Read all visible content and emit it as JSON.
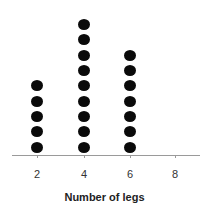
{
  "chart_data": {
    "type": "dot",
    "title": "",
    "xlabel": "Number of legs",
    "ylabel": "",
    "categories": [
      "2",
      "4",
      "6",
      "8"
    ],
    "x": [
      2,
      4,
      6,
      8
    ],
    "values": [
      5,
      9,
      7,
      0
    ],
    "xlim": [
      1.2,
      9.0
    ],
    "xticks": [
      2,
      4,
      6,
      8
    ],
    "grid": false,
    "legend": null,
    "marker_color": "#0a0a0a"
  },
  "layout": {
    "x_px": {
      "2": 37,
      "4": 84,
      "6": 130,
      "8": 175
    },
    "baseline_center_y": 147,
    "dot_spacing": 15.3
  }
}
